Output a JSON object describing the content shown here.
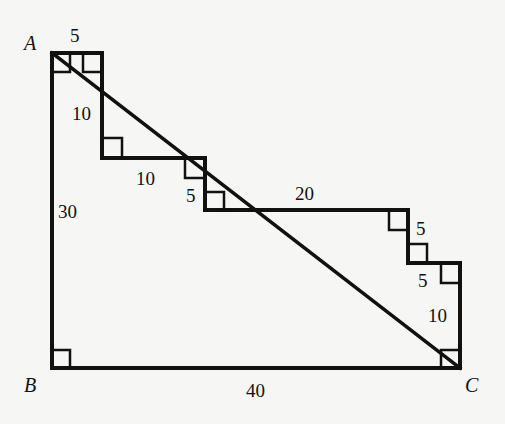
{
  "diagram": {
    "type": "geometry-figure",
    "vertices": {
      "A": "A",
      "B": "B",
      "C": "C"
    },
    "labels": {
      "top_5": "5",
      "left_step_10": "10",
      "mid_10": "10",
      "mid_5": "5",
      "top_20": "20",
      "right_5a": "5",
      "right_5b": "5",
      "right_10": "10",
      "side_30": "30",
      "bottom_40": "40"
    },
    "colors": {
      "background": "#f6f6f4",
      "stroke": "#111111"
    }
  }
}
